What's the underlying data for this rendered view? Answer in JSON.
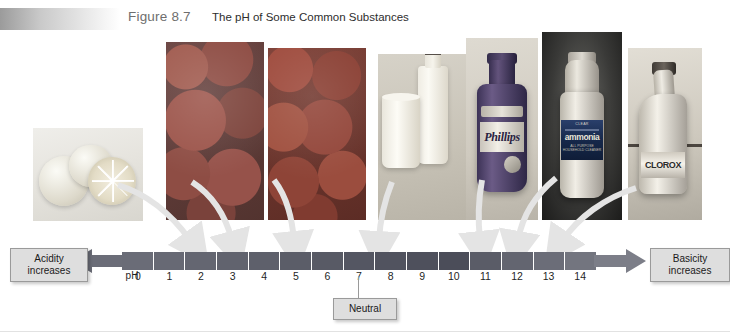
{
  "header": {
    "figure_label": "Figure 8.7",
    "figure_title": "The pH of Some Common Substances"
  },
  "labels": {
    "acidity": "Acidity\nincreases",
    "acidity_line1": "Acidity",
    "acidity_line2": "increases",
    "basicity_line1": "Basicity",
    "basicity_line2": "increases",
    "neutral": "Neutral",
    "ph_axis_label": "pH"
  },
  "photos": [
    {
      "name": "lemons",
      "substance": "Lemons",
      "ph": 2.2
    },
    {
      "name": "strawberries",
      "substance": "Strawberries",
      "ph": 3.2
    },
    {
      "name": "tomatoes",
      "substance": "Tomatoes",
      "ph": 4.2
    },
    {
      "name": "milk",
      "substance": "Milk",
      "ph": 6.6
    },
    {
      "name": "phillips",
      "substance": "Phillips",
      "ph": 10.4
    },
    {
      "name": "ammonia",
      "substance": "Ammonia",
      "ph": 11.1
    },
    {
      "name": "clorox",
      "substance": "Clorox",
      "ph": 12.1
    }
  ],
  "product_text": {
    "phillips_brand": "Phillips",
    "ammonia_top": "CLEAR",
    "ammonia_brand": "ammonia",
    "ammonia_sub": "ALL PURPOSE HOUSEHOLD CLEANER",
    "clorox_brand": "CLOROX"
  },
  "colors": {
    "scale_dark_acid": "#5d5f6b",
    "scale_dark_base": "#3d404c",
    "arrow_gray": "#8c8f99",
    "pointer_gray": "#e7e7e7",
    "label_box_fill": "#dedede",
    "label_box_border": "#9a9a9a",
    "header_band": "#9b9b9b",
    "title_color": "#6e6e6e"
  },
  "chart_data": {
    "type": "bar",
    "title": "The pH of Some Common Substances",
    "xlabel": "pH",
    "ylabel": "",
    "categories": [
      "0",
      "1",
      "2",
      "3",
      "4",
      "5",
      "6",
      "7",
      "8",
      "9",
      "10",
      "11",
      "12",
      "13",
      "14"
    ],
    "tick_labels": [
      "0",
      "1",
      "2",
      "3",
      "4",
      "5",
      "6",
      "7",
      "8",
      "9",
      "10",
      "11",
      "12",
      "13",
      "14"
    ],
    "xlim": [
      0,
      14
    ],
    "grid": false,
    "legend": "none",
    "annotations": [
      {
        "text": "Acidity increases",
        "at": "left-end"
      },
      {
        "text": "Basicity increases",
        "at": "right-end"
      },
      {
        "text": "Neutral",
        "at": 7
      }
    ],
    "series": [
      {
        "name": "Common substances plotted on pH scale",
        "points": [
          {
            "label": "Lemons",
            "x": 2.2
          },
          {
            "label": "Strawberries",
            "x": 3.2
          },
          {
            "label": "Tomatoes",
            "x": 4.2
          },
          {
            "label": "Milk",
            "x": 6.6
          },
          {
            "label": "Phillips",
            "x": 10.4
          },
          {
            "label": "Ammonia",
            "x": 11.1
          },
          {
            "label": "Clorox",
            "x": 12.1
          }
        ]
      }
    ]
  }
}
